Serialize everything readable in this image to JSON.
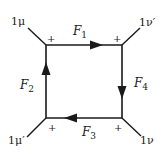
{
  "diagram": {
    "type": "box-loop",
    "colors": {
      "line": "#1a1a1a",
      "background": "#ffffff"
    },
    "corners": {
      "top_left": {
        "sign": "+",
        "label": "1μ"
      },
      "top_right": {
        "sign": "+",
        "label": "1ν′"
      },
      "bottom_right": {
        "sign": "+",
        "label": "1ν"
      },
      "bottom_left": {
        "sign": "+",
        "label": "1μ′"
      }
    },
    "edges": {
      "top": {
        "label_main": "F",
        "label_sub": "1",
        "arrow": "right"
      },
      "left": {
        "label_main": "F",
        "label_sub": "2",
        "arrow": "up"
      },
      "bottom": {
        "label_main": "F",
        "label_sub": "3",
        "arrow": "left"
      },
      "right": {
        "label_main": "F",
        "label_sub": "4",
        "arrow": "down"
      }
    }
  }
}
